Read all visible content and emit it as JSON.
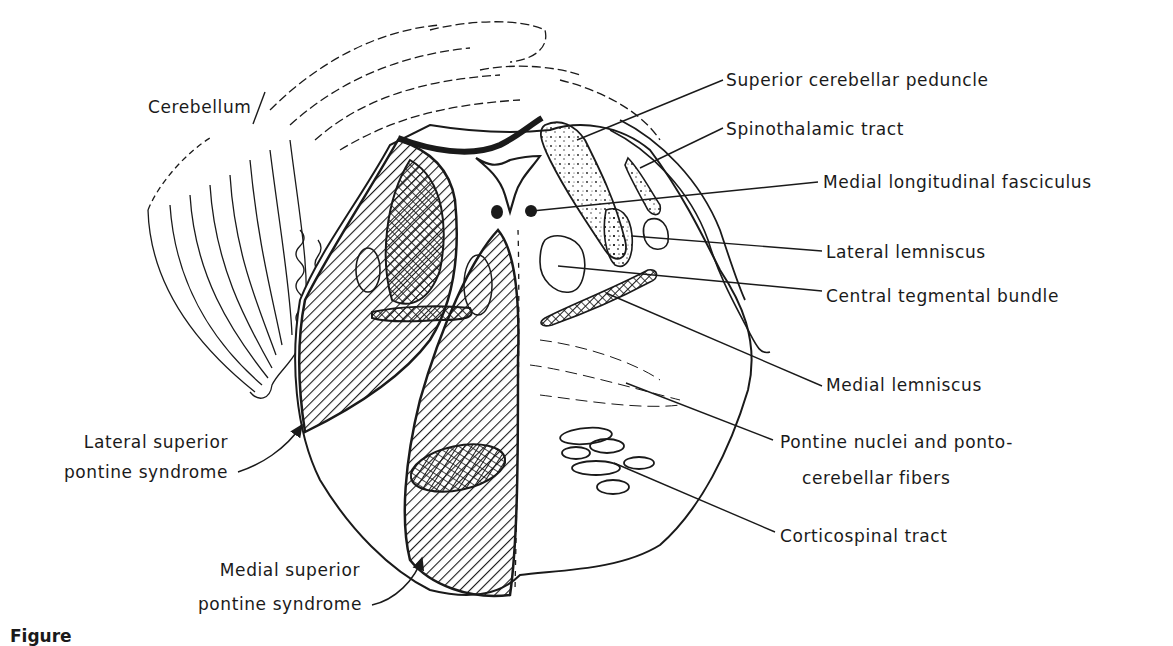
{
  "figure": {
    "caption_visible": "Figure",
    "labels": {
      "cerebellum": "Cerebellum",
      "superior_cerebellar_peduncle": "Superior cerebellar peduncle",
      "spinothalamic_tract": "Spinothalamic tract",
      "medial_longitudinal_fasciculus": "Medial longitudinal fasciculus",
      "lateral_lemniscus": "Lateral lemniscus",
      "central_tegmental_bundle": "Central tegmental bundle",
      "medial_lemniscus": "Medial lemniscus",
      "pontine_nuclei_line1": "Pontine nuclei and ponto-",
      "pontine_nuclei_line2": "cerebellar fibers",
      "corticospinal_tract": "Corticospinal tract",
      "lateral_syndrome_line1": "Lateral superior",
      "lateral_syndrome_line2": "pontine syndrome",
      "medial_syndrome_line1": "Medial superior",
      "medial_syndrome_line2": "pontine syndrome"
    },
    "colors": {
      "ink": "#1a1a1a",
      "paper": "#ffffff"
    }
  }
}
